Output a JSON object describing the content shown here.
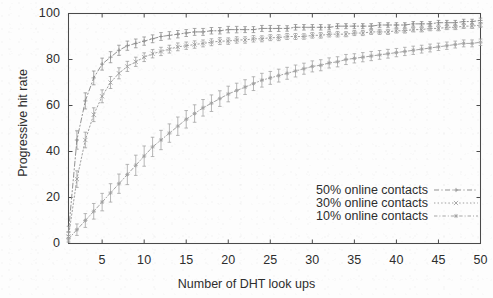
{
  "chart_data": {
    "type": "line",
    "title": "",
    "subtitle": "",
    "xlabel": "Number of DHT look ups",
    "ylabel": "Progressive hit rate",
    "xlim": [
      1,
      50
    ],
    "ylim": [
      0,
      100
    ],
    "xticks": [
      5,
      10,
      15,
      20,
      25,
      30,
      35,
      40,
      45,
      50
    ],
    "yticks": [
      0,
      20,
      40,
      60,
      80,
      100
    ],
    "xtick_labels": [
      "5",
      "10",
      "15",
      "20",
      "25",
      "30",
      "35",
      "40",
      "45",
      "50"
    ],
    "ytick_labels": [
      "0",
      "20",
      "40",
      "60",
      "80",
      "100"
    ],
    "grid": false,
    "legend_position": "lower-right-inside",
    "error_bars": true,
    "x": [
      1,
      2,
      3,
      4,
      5,
      6,
      7,
      8,
      9,
      10,
      11,
      12,
      13,
      14,
      15,
      16,
      17,
      18,
      19,
      20,
      21,
      22,
      23,
      24,
      25,
      26,
      27,
      28,
      29,
      30,
      31,
      32,
      33,
      34,
      35,
      36,
      37,
      38,
      39,
      40,
      41,
      42,
      43,
      44,
      45,
      46,
      47,
      48,
      49,
      50
    ],
    "series": [
      {
        "name": "50% online contacts",
        "color": "#8c8c8c",
        "linestyle": "dash-dot",
        "marker": "plus",
        "values": [
          5,
          45,
          62,
          72,
          78,
          81,
          84,
          86,
          87,
          88,
          89,
          90,
          90.5,
          91,
          91.5,
          92,
          92,
          92.5,
          92.5,
          93,
          93,
          93,
          93,
          93.5,
          93.5,
          93.5,
          93.5,
          94,
          94,
          94,
          94,
          94,
          94.5,
          94.5,
          94.5,
          94.5,
          94.5,
          95,
          95,
          95,
          95,
          95.5,
          95.5,
          95.5,
          96,
          96,
          96,
          96.5,
          96.5,
          97
        ],
        "errors": [
          2.5,
          4,
          3.5,
          3,
          2.6,
          2.4,
          2.2,
          2,
          1.9,
          1.8,
          1.7,
          1.7,
          1.6,
          1.6,
          1.5,
          1.5,
          1.5,
          1.4,
          1.4,
          1.4,
          1.4,
          1.3,
          1.3,
          1.3,
          1.3,
          1.3,
          1.2,
          1.2,
          1.2,
          1.2,
          1.2,
          1.1,
          1.1,
          1.1,
          1.1,
          1.1,
          1.1,
          1,
          1,
          1,
          1,
          1,
          1,
          1,
          1,
          1,
          1,
          1,
          1,
          1
        ]
      },
      {
        "name": "30% online contacts",
        "color": "#9a9a9a",
        "linestyle": "dotted",
        "marker": "cross",
        "values": [
          3,
          28,
          45,
          56,
          64,
          70,
          74,
          77,
          79,
          81,
          82.5,
          83.5,
          84.5,
          85.5,
          86,
          86.5,
          87,
          87.5,
          88,
          88,
          88.5,
          88.5,
          89,
          89,
          89.5,
          89.5,
          90,
          90,
          90,
          90.5,
          90.5,
          91,
          91,
          91,
          91.5,
          91.5,
          92,
          92,
          92,
          92.5,
          92.5,
          93,
          93,
          93.5,
          93.5,
          94,
          94,
          94.5,
          94.5,
          95
        ],
        "errors": [
          2,
          3.6,
          3.4,
          3,
          2.8,
          2.6,
          2.4,
          2.2,
          2,
          1.9,
          1.8,
          1.8,
          1.7,
          1.7,
          1.6,
          1.6,
          1.5,
          1.5,
          1.5,
          1.4,
          1.4,
          1.4,
          1.4,
          1.3,
          1.3,
          1.3,
          1.3,
          1.3,
          1.2,
          1.2,
          1.2,
          1.2,
          1.2,
          1.1,
          1.1,
          1.1,
          1.1,
          1.1,
          1.1,
          1,
          1,
          1,
          1,
          1,
          1,
          1,
          1,
          1,
          1,
          1
        ]
      },
      {
        "name": "10% online contacts",
        "color": "#a0a0a0",
        "linestyle": "dash-dot-fine",
        "marker": "star",
        "values": [
          2,
          6,
          10,
          14,
          18,
          22,
          26,
          30,
          34,
          38,
          42,
          45,
          48,
          51,
          54,
          56.5,
          59,
          61,
          63,
          65,
          66.5,
          68,
          69.5,
          71,
          72,
          73,
          74,
          75,
          76,
          77,
          77.5,
          78.5,
          79,
          80,
          80.5,
          81,
          81.5,
          82,
          82.5,
          83,
          83.5,
          84,
          84.5,
          85,
          85.5,
          86,
          86.5,
          87,
          87,
          87.5
        ],
        "errors": [
          1.5,
          2.5,
          3,
          3.4,
          3.8,
          4,
          4.2,
          4.4,
          4.4,
          4.4,
          4.2,
          4.2,
          4,
          4,
          3.8,
          3.8,
          3.6,
          3.6,
          3.4,
          3.4,
          3.2,
          3.2,
          3,
          3,
          2.8,
          2.8,
          2.6,
          2.6,
          2.4,
          2.4,
          2.4,
          2.2,
          2.2,
          2.2,
          2,
          2,
          2,
          1.9,
          1.9,
          1.8,
          1.8,
          1.8,
          1.7,
          1.7,
          1.6,
          1.6,
          1.5,
          1.5,
          1.5,
          1.4
        ]
      }
    ],
    "legend": [
      "50% online contacts",
      "30% online contacts",
      "10% online contacts"
    ]
  }
}
